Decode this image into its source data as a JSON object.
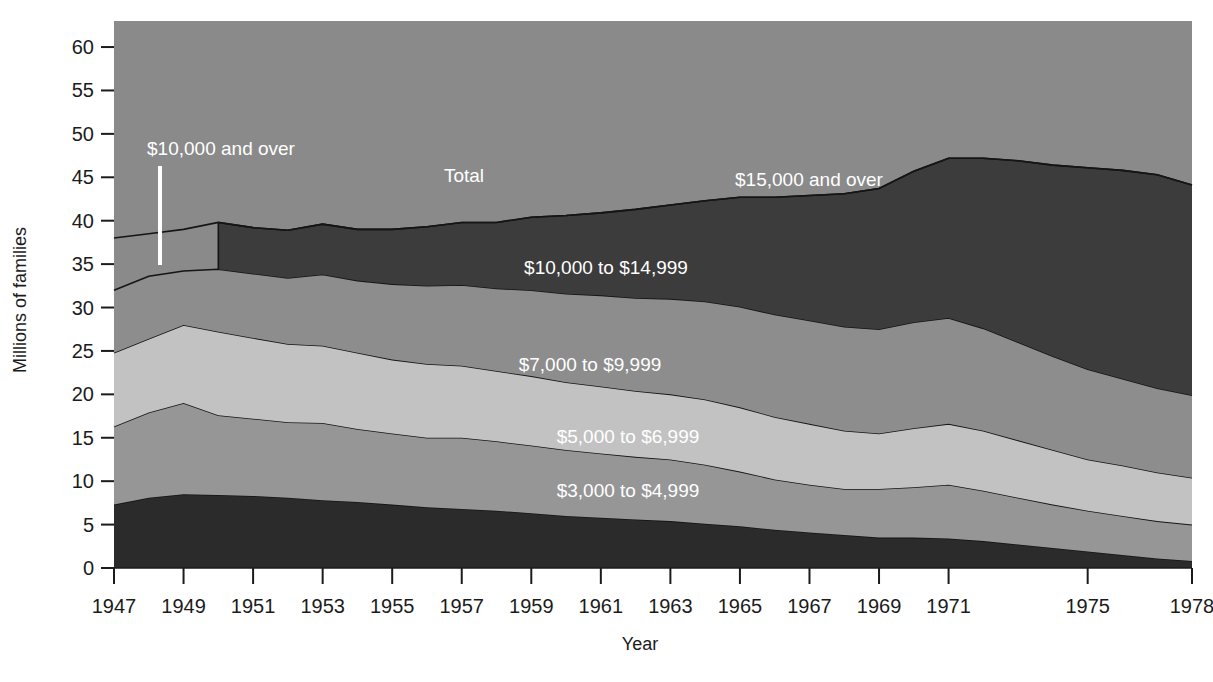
{
  "chart_data": {
    "type": "area",
    "title": "",
    "subtitle": "",
    "xlabel": "Year",
    "ylabel": "Millions of families",
    "stacked": true,
    "grid": false,
    "legend_position": "inline-labels",
    "xlim": [
      1947,
      1978
    ],
    "ylim": [
      0,
      63
    ],
    "ytick_values": [
      0,
      5,
      10,
      15,
      20,
      25,
      30,
      35,
      40,
      45,
      50,
      55,
      60
    ],
    "ytick_labels": [
      "0",
      "5",
      "10",
      "15",
      "20",
      "25",
      "30",
      "35",
      "40",
      "45",
      "50",
      "55",
      "60"
    ],
    "xtick_values": [
      1947,
      1949,
      1951,
      1953,
      1955,
      1957,
      1959,
      1961,
      1963,
      1965,
      1967,
      1969,
      1971,
      1975,
      1978
    ],
    "xtick_labels": [
      "1947",
      "1949",
      "1951",
      "1953",
      "1955",
      "1957",
      "1959",
      "1961",
      "1963",
      "1965",
      "1967",
      "1969",
      "1971",
      "1975",
      "1978"
    ],
    "x": [
      1947,
      1948,
      1949,
      1950,
      1951,
      1952,
      1953,
      1954,
      1955,
      1956,
      1957,
      1958,
      1959,
      1960,
      1961,
      1962,
      1963,
      1964,
      1965,
      1966,
      1967,
      1968,
      1969,
      1970,
      1971,
      1972,
      1973,
      1974,
      1975,
      1976,
      1977,
      1978
    ],
    "series": [
      {
        "name": "$3,000 to $4,999",
        "color": "#2b2b2b",
        "label_color": "#ffffff",
        "values": [
          7.3,
          8.1,
          8.5,
          8.4,
          8.3,
          8.1,
          7.8,
          7.6,
          7.3,
          7.0,
          6.8,
          6.6,
          6.3,
          6.0,
          5.8,
          5.6,
          5.4,
          5.1,
          4.8,
          4.4,
          4.1,
          3.8,
          3.5,
          3.5,
          3.4,
          3.1,
          2.7,
          2.3,
          1.9,
          1.5,
          1.1,
          0.8
        ]
      },
      {
        "name": "$5,000 to $6,999",
        "color": "#969696",
        "label_color": "#ffffff",
        "values": [
          9.0,
          9.8,
          10.5,
          9.2,
          8.9,
          8.7,
          8.9,
          8.4,
          8.2,
          8.0,
          8.2,
          8.0,
          7.8,
          7.6,
          7.4,
          7.2,
          7.1,
          6.8,
          6.3,
          5.8,
          5.5,
          5.3,
          5.6,
          5.8,
          6.2,
          5.8,
          5.4,
          5.0,
          4.7,
          4.5,
          4.3,
          4.2
        ]
      },
      {
        "name": "$7,000 to $9,999",
        "color": "#c2c2c2",
        "label_color": "#ffffff",
        "values": [
          8.5,
          8.5,
          9.0,
          9.6,
          9.3,
          9.0,
          8.9,
          8.8,
          8.5,
          8.5,
          8.3,
          8.1,
          8.0,
          7.8,
          7.7,
          7.6,
          7.5,
          7.5,
          7.4,
          7.2,
          7.0,
          6.7,
          6.4,
          6.8,
          7.0,
          6.9,
          6.6,
          6.3,
          5.9,
          5.8,
          5.6,
          5.4
        ]
      },
      {
        "name": "$10,000 to $14,999",
        "color": "#8d8d8d",
        "label_color": "#ffffff",
        "values": [
          7.2,
          7.2,
          6.2,
          7.2,
          7.4,
          7.6,
          8.2,
          8.3,
          8.7,
          9.0,
          9.3,
          9.5,
          9.9,
          10.2,
          10.5,
          10.7,
          11.0,
          11.3,
          11.6,
          11.8,
          11.9,
          12.0,
          12.0,
          12.2,
          12.2,
          11.8,
          11.3,
          10.8,
          10.4,
          10.0,
          9.7,
          9.5
        ]
      },
      {
        "name": "$15,000 and over",
        "color": "#3c3c3c",
        "label_color": "#ffffff",
        "values": [
          null,
          null,
          null,
          5.4,
          5.3,
          5.5,
          5.8,
          5.9,
          6.3,
          6.8,
          7.2,
          7.6,
          8.4,
          9.0,
          9.5,
          10.2,
          10.8,
          11.6,
          12.6,
          13.5,
          14.4,
          15.3,
          16.2,
          17.4,
          18.4,
          19.6,
          20.9,
          22.0,
          23.2,
          24.0,
          24.6,
          24.2
        ]
      }
    ],
    "total_line": {
      "name": "Total",
      "values": [
        38.0,
        38.5,
        39.0,
        39.8,
        39.2,
        38.9,
        39.6,
        39.0,
        39.0,
        39.3,
        39.8,
        39.8,
        40.4,
        40.6,
        40.9,
        41.3,
        41.8,
        42.3,
        42.7,
        42.7,
        42.9,
        43.1,
        43.7,
        45.7,
        47.2,
        47.2,
        46.9,
        46.4,
        46.1,
        45.8,
        45.3,
        44.1
      ]
    },
    "annotations": [
      {
        "text": "$10,000 and over",
        "x_px": 221,
        "y_px": 155,
        "anchor": "middle",
        "color": "#ffffff"
      },
      {
        "text": "Total",
        "x_px": 464,
        "y_px": 182,
        "anchor": "middle",
        "color": "#ffffff"
      },
      {
        "text": "$15,000 and over",
        "x_px": 809,
        "y_px": 186,
        "anchor": "middle",
        "color": "#ffffff"
      },
      {
        "text": "$10,000 to $14,999",
        "x_px": 606,
        "y_px": 274,
        "anchor": "middle",
        "color": "#ffffff"
      },
      {
        "text": "$7,000 to $9,999",
        "x_px": 590,
        "y_px": 371,
        "anchor": "middle",
        "color": "#ffffff"
      },
      {
        "text": "$5,000 to $6,999",
        "x_px": 628,
        "y_px": 443,
        "anchor": "middle",
        "color": "#ffffff"
      },
      {
        "text": "$3,000 to $4,999",
        "x_px": 628,
        "y_px": 497,
        "anchor": "middle",
        "color": "#ffffff"
      }
    ],
    "leader_line": {
      "x_px": 160,
      "y1_px": 166,
      "y2_px": 265,
      "color": "#ffffff"
    },
    "background_color": "#8a8a8a",
    "break_year": 1950
  }
}
